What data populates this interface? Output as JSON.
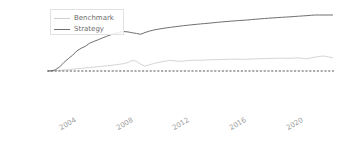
{
  "chart_data": {
    "type": "line",
    "title": "",
    "xlabel": "",
    "ylabel": "",
    "yscale": "symlog",
    "grid": false,
    "legend_position": "upper left",
    "ytick_labels": [
      "100K%",
      "10K%",
      "1K%",
      "100%",
      "0%",
      "-100%",
      "-1000%",
      "-10000%"
    ],
    "ytick_values": [
      100000,
      10000,
      1000,
      100,
      0,
      -100,
      -1000,
      -10000
    ],
    "xtick_labels": [
      "2004",
      "2008",
      "2012",
      "2016",
      "2020"
    ],
    "xtick_values": [
      2004,
      2008,
      2012,
      2016,
      2020
    ],
    "xlim": [
      2002.4,
      2022.6
    ],
    "annotations": [
      "dashed zero line at 0%"
    ],
    "series": [
      {
        "name": "Benchmark",
        "color": "#cfcfcf",
        "x": [
          2002.5,
          2002.8,
          2003.0,
          2003.3,
          2003.6,
          2003.9,
          2004.2,
          2004.5,
          2004.8,
          2005.1,
          2005.4,
          2005.7,
          2006.0,
          2006.3,
          2006.6,
          2006.9,
          2007.2,
          2007.5,
          2007.8,
          2008.1,
          2008.4,
          2008.7,
          2009.0,
          2009.3,
          2009.6,
          2009.9,
          2010.2,
          2010.5,
          2010.8,
          2011.1,
          2011.4,
          2011.7,
          2012.0,
          2012.3,
          2012.6,
          2012.9,
          2013.2,
          2013.5,
          2013.8,
          2014.1,
          2014.4,
          2014.7,
          2015.0,
          2015.3,
          2015.6,
          2015.9,
          2016.2,
          2016.5,
          2016.8,
          2017.1,
          2017.4,
          2017.7,
          2018.0,
          2018.3,
          2018.6,
          2018.9,
          2019.2,
          2019.5,
          2019.8,
          2020.1,
          2020.4,
          2020.7,
          2021.0,
          2021.3,
          2021.6,
          2021.9,
          2022.2,
          2022.5
        ],
        "values": [
          0,
          2,
          5,
          9,
          14,
          20,
          26,
          32,
          38,
          44,
          50,
          56,
          62,
          68,
          74,
          80,
          88,
          96,
          104,
          118,
          150,
          135,
          95,
          70,
          88,
          105,
          118,
          128,
          140,
          148,
          142,
          134,
          138,
          145,
          150,
          152,
          150,
          154,
          158,
          160,
          162,
          164,
          166,
          168,
          170,
          168,
          166,
          168,
          172,
          175,
          178,
          180,
          182,
          185,
          188,
          190,
          186,
          188,
          192,
          196,
          186,
          176,
          196,
          215,
          232,
          240,
          218,
          196
        ]
      },
      {
        "name": "Strategy",
        "color": "#6f6f6f",
        "x": [
          2002.5,
          2002.8,
          2003.0,
          2003.3,
          2003.6,
          2003.9,
          2004.2,
          2004.5,
          2004.8,
          2005.1,
          2005.4,
          2005.7,
          2006.0,
          2006.3,
          2006.6,
          2006.9,
          2007.2,
          2007.5,
          2007.8,
          2008.1,
          2008.4,
          2008.7,
          2009.0,
          2009.3,
          2009.6,
          2009.9,
          2010.2,
          2010.5,
          2010.8,
          2011.1,
          2011.4,
          2011.7,
          2012.0,
          2012.3,
          2012.6,
          2012.9,
          2013.2,
          2013.5,
          2013.8,
          2014.1,
          2014.4,
          2014.7,
          2015.0,
          2015.3,
          2015.6,
          2015.9,
          2016.2,
          2016.5,
          2016.8,
          2017.1,
          2017.4,
          2017.7,
          2018.0,
          2018.3,
          2018.6,
          2018.9,
          2019.2,
          2019.5,
          2019.8,
          2020.1,
          2020.4,
          2020.7,
          2021.0,
          2021.3,
          2021.6,
          2021.9,
          2022.2,
          2022.5
        ],
        "values": [
          0,
          5,
          20,
          60,
          120,
          180,
          260,
          420,
          560,
          700,
          980,
          1300,
          1700,
          2300,
          3000,
          3900,
          4800,
          5800,
          6600,
          6200,
          5400,
          4800,
          4200,
          5600,
          7000,
          8400,
          9600,
          10800,
          12000,
          13200,
          14500,
          15800,
          17200,
          18600,
          20000,
          21500,
          23000,
          24500,
          26000,
          28000,
          30000,
          32000,
          34000,
          36000,
          38000,
          40000,
          42000,
          44000,
          47000,
          50000,
          53000,
          56000,
          59000,
          62000,
          65000,
          68000,
          71000,
          74000,
          78000,
          82000,
          86000,
          90000,
          96000,
          102000,
          108000,
          112000,
          110000,
          108000
        ]
      }
    ],
    "zero_line": {
      "value": 0,
      "style": "dashed",
      "color": "#4a4a4a"
    }
  },
  "legend": {
    "items": [
      {
        "label": "Benchmark",
        "color": "#cfcfcf"
      },
      {
        "label": "Strategy",
        "color": "#6f6f6f"
      }
    ]
  }
}
